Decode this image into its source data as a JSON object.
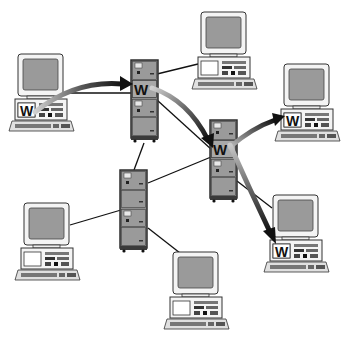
{
  "diagram": {
    "type": "network",
    "colors": {
      "background": "#ffffff",
      "screen": "#9a9a9a",
      "bezel": "#f2f2f2",
      "server_body": "#8c8c8c",
      "server_frame": "#3a3a3a",
      "link": "#111111",
      "arrow_dark": "#111111",
      "arrow_light": "#c8c8c8"
    },
    "nodes": [
      {
        "id": "pc1",
        "kind": "workstation",
        "x": 15,
        "y": 54,
        "has_doc": true,
        "doc_label": "W"
      },
      {
        "id": "pc2",
        "kind": "workstation",
        "x": 198,
        "y": 12,
        "has_doc": false
      },
      {
        "id": "pc3",
        "kind": "workstation",
        "x": 281,
        "y": 64,
        "has_doc": true,
        "doc_label": "W"
      },
      {
        "id": "pc4",
        "kind": "workstation",
        "x": 270,
        "y": 195,
        "has_doc": true,
        "doc_label": "W"
      },
      {
        "id": "pc5",
        "kind": "workstation",
        "x": 21,
        "y": 203,
        "has_doc": false
      },
      {
        "id": "pc6",
        "kind": "workstation",
        "x": 170,
        "y": 252,
        "has_doc": false
      },
      {
        "id": "srv1",
        "kind": "server",
        "x": 131,
        "y": 60,
        "has_doc": true,
        "doc_label": "W"
      },
      {
        "id": "srv2",
        "kind": "server",
        "x": 210,
        "y": 120,
        "has_doc": true,
        "doc_label": "W"
      },
      {
        "id": "srv3",
        "kind": "server",
        "x": 120,
        "y": 170,
        "has_doc": false
      }
    ],
    "links": [
      {
        "from": "pc1",
        "to": "srv1"
      },
      {
        "from": "pc2",
        "to": "srv1"
      },
      {
        "from": "srv1",
        "to": "srv2"
      },
      {
        "from": "srv1",
        "to": "srv3"
      },
      {
        "from": "srv3",
        "to": "srv2"
      },
      {
        "from": "srv3",
        "to": "pc5"
      },
      {
        "from": "srv3",
        "to": "pc6"
      },
      {
        "from": "srv2",
        "to": "pc4"
      },
      {
        "from": "srv2",
        "to": "pc3"
      }
    ],
    "flows": [
      {
        "from": "pc1",
        "to": "srv1",
        "label": "W"
      },
      {
        "from": "srv1",
        "to": "srv2",
        "label": "W"
      },
      {
        "from": "srv2",
        "to": "pc3",
        "label": "W"
      },
      {
        "from": "srv2",
        "to": "pc4",
        "label": "W"
      }
    ],
    "doc_label": "W"
  }
}
